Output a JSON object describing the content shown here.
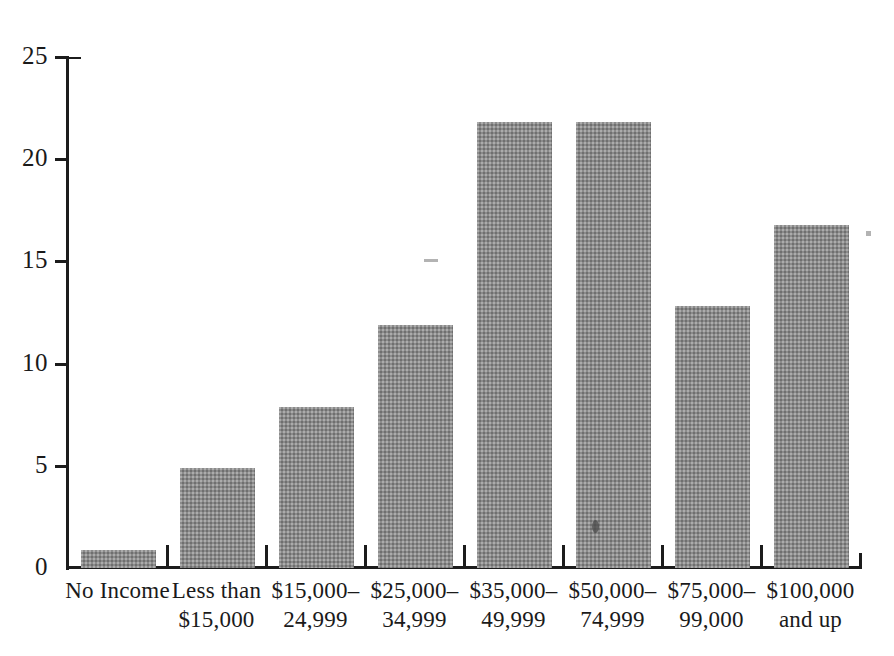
{
  "chart_data": {
    "type": "bar",
    "title": "",
    "xlabel": "",
    "ylabel": "",
    "ylim": [
      0,
      25
    ],
    "yticks": [
      0,
      5,
      10,
      15,
      20,
      25
    ],
    "grid": false,
    "legend": null,
    "categories": [
      "No Income",
      "Less than\n$15,000",
      "$15,000–\n24,999",
      "$25,000–\n34,999",
      "$35,000–\n49,999",
      "$50,000–\n74,999",
      "$75,000–\n99,000",
      "$100,000\nand up"
    ],
    "values": [
      0.9,
      4.9,
      7.9,
      11.9,
      21.8,
      21.8,
      12.8,
      16.8
    ],
    "bar_color": "#8b8b8b"
  },
  "axis": {
    "tick_labels": [
      "0",
      "5",
      "10",
      "15",
      "20",
      "25"
    ]
  }
}
